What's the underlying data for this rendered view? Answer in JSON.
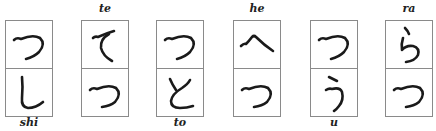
{
  "columns": [
    {
      "top_label": "",
      "bottom_label": "shi",
      "upper_kana": "つ",
      "lower_kana": "し"
    },
    {
      "top_label": "te",
      "bottom_label": "",
      "upper_kana": "て",
      "lower_kana": "つ"
    },
    {
      "top_label": "",
      "bottom_label": "to",
      "upper_kana": "つ",
      "lower_kana": "と"
    },
    {
      "top_label": "he",
      "bottom_label": "",
      "upper_kana": "へ",
      "lower_kana": "つ"
    },
    {
      "top_label": "",
      "bottom_label": "u",
      "upper_kana": "つ",
      "lower_kana": "う"
    },
    {
      "top_label": "ra",
      "bottom_label": "",
      "upper_kana": "ら",
      "lower_kana": "つ"
    }
  ],
  "colors": {
    "border": "#8a8a8a",
    "ink": "#1a1a1a",
    "label": "#222222"
  }
}
